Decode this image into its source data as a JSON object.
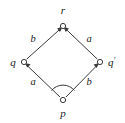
{
  "diagram": {
    "kind": "commutative-square",
    "background_color": "#ffffff",
    "stroke_color": "#3a3a3a",
    "text_color": "#1a1a1a",
    "nodes": [
      {
        "id": "r",
        "label": "r",
        "x": 63,
        "y": 26,
        "label_x": 63,
        "label_y": 14,
        "label_anchor": "middle"
      },
      {
        "id": "q",
        "label": "q",
        "x": 24,
        "y": 62,
        "label_x": 13,
        "label_y": 66,
        "label_anchor": "middle"
      },
      {
        "id": "qp",
        "label": "q",
        "prime": "′",
        "x": 100,
        "y": 62,
        "label_x": 108,
        "label_y": 66,
        "label_anchor": "start"
      },
      {
        "id": "p",
        "label": "p",
        "x": 63,
        "y": 100,
        "label_x": 63,
        "label_y": 117,
        "label_anchor": "middle"
      }
    ],
    "edges": [
      {
        "id": "q-to-r",
        "from": "q",
        "to": "r",
        "label": "b",
        "label_x": 33,
        "label_y": 42
      },
      {
        "id": "qp-to-r",
        "from": "qp",
        "to": "r",
        "label": "a",
        "label_x": 89,
        "label_y": 42
      },
      {
        "id": "p-to-q",
        "from": "p",
        "to": "q",
        "label": "a",
        "label_x": 33,
        "label_y": 85
      },
      {
        "id": "p-to-qp",
        "from": "p",
        "to": "qp",
        "label": "b",
        "label_x": 89,
        "label_y": 85
      }
    ],
    "arc_marker": {
      "id": "commute-arc",
      "center_x": 63,
      "center_y": 100,
      "radius": 15
    },
    "node_radius": 2.6
  }
}
